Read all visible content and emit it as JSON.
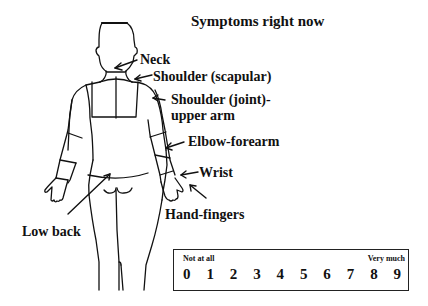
{
  "title": "Symptoms right now",
  "body_regions": [
    {
      "id": "neck",
      "label": "Neck"
    },
    {
      "id": "shoulder-scapular",
      "label": "Shoulder (scapular)"
    },
    {
      "id": "shoulder-joint",
      "label": "Shoulder (joint)-",
      "label2": "upper arm"
    },
    {
      "id": "elbow-forearm",
      "label": "Elbow-forearm"
    },
    {
      "id": "wrist",
      "label": "Wrist"
    },
    {
      "id": "hand-fingers",
      "label": "Hand-fingers"
    },
    {
      "id": "low-back",
      "label": "Low back"
    }
  ],
  "scale": {
    "low_label": "Not at all",
    "high_label": "Very much",
    "values": [
      "0",
      "1",
      "2",
      "3",
      "4",
      "5",
      "6",
      "7",
      "8",
      "9"
    ]
  },
  "colors": {
    "ink": "#111111",
    "background": "#ffffff"
  }
}
